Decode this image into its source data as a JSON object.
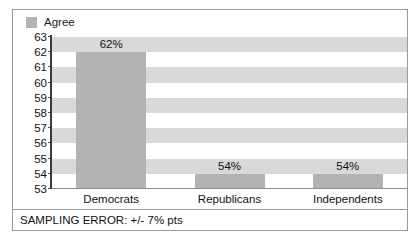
{
  "legend": {
    "entries": [
      {
        "label": "Agree",
        "color": "#b3b3b3"
      }
    ]
  },
  "footer": {
    "note": "SAMPLING ERROR: +/- 7% pts"
  },
  "chart_data": {
    "type": "bar",
    "title": "",
    "xlabel": "",
    "ylabel": "",
    "categories": [
      "Democrats",
      "Republicans",
      "Independents"
    ],
    "series": [
      {
        "name": "Agree",
        "values": [
          62,
          54,
          54
        ],
        "color": "#b3b3b3"
      }
    ],
    "data_labels": [
      "62%",
      "54%",
      "54%"
    ],
    "ylim": [
      53,
      63
    ],
    "yticks": [
      63,
      62,
      61,
      60,
      59,
      58,
      57,
      56,
      55,
      54,
      53
    ],
    "ytick_labels": [
      "63",
      "62",
      "61",
      "60",
      "59",
      "58",
      "57",
      "56",
      "55",
      "54",
      "53"
    ],
    "grid": "horizontal-alternating-bands",
    "band_color": "#d9d9d9",
    "plot_background": "#ffffff",
    "legend_position": "top-left",
    "annotations": [
      "SAMPLING ERROR: +/- 7% pts"
    ]
  }
}
